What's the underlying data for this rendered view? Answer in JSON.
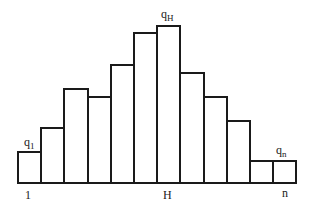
{
  "chart_data": {
    "type": "bar",
    "title": "",
    "xlabel": "",
    "ylabel": "",
    "grid": false,
    "legend": null,
    "categories": [
      "1",
      "2",
      "3",
      "4",
      "5",
      "6",
      "7",
      "8",
      "9",
      "10",
      "11",
      "n"
    ],
    "values": [
      32,
      56,
      95,
      87,
      119,
      151,
      158,
      111,
      87,
      63,
      23,
      23
    ],
    "units": "relative height (px)",
    "x_tick_labels": [
      {
        "text": "1",
        "bar_index": 0
      },
      {
        "text": "H",
        "bar_index": 6
      },
      {
        "text": "n",
        "bar_index": 11
      }
    ],
    "annotations": [
      {
        "base": "q",
        "sub": "1",
        "bar_index": 0
      },
      {
        "base": "q",
        "sub": "H",
        "bar_index": 6
      },
      {
        "base": "q",
        "sub": "n",
        "bar_index": 11
      }
    ],
    "layout": {
      "baseline_y": 183,
      "first_bar_x": 17,
      "bar_width": 23.2
    }
  },
  "labels": {
    "q1_base": "q",
    "q1_sub": "1",
    "qH_base": "q",
    "qH_sub": "H",
    "qn_base": "q",
    "qn_sub": "n",
    "tick_first": "1",
    "tick_peak": "H",
    "tick_last": "n"
  }
}
